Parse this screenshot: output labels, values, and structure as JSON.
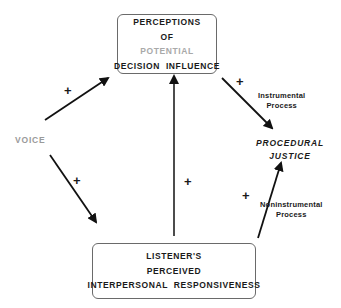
{
  "diagram": {
    "nodes": {
      "voice": {
        "label": "VOICE"
      },
      "perceptions": {
        "lines": [
          "PERCEPTIONS",
          "OF",
          "POTENTIAL",
          "DECISION  INFLUENCE"
        ]
      },
      "listener": {
        "lines": [
          "LISTENER'S",
          "PERCEIVED",
          "INTERPERSONAL  RESPONSIVENESS"
        ]
      },
      "procedural_justice": {
        "lines": [
          "PROCEDURAL",
          "JUSTICE"
        ]
      }
    },
    "edges": [
      {
        "from": "voice",
        "to": "perceptions",
        "sign": "+"
      },
      {
        "from": "voice",
        "to": "listener",
        "sign": "+"
      },
      {
        "from": "listener",
        "to": "perceptions",
        "sign": "+"
      },
      {
        "from": "perceptions",
        "to": "procedural_justice",
        "sign": "+",
        "label_lines": [
          "Instrumental",
          "Process"
        ]
      },
      {
        "from": "listener",
        "to": "procedural_justice",
        "sign": "+",
        "label_lines": [
          "Noninstrumental",
          "Process"
        ]
      }
    ]
  }
}
